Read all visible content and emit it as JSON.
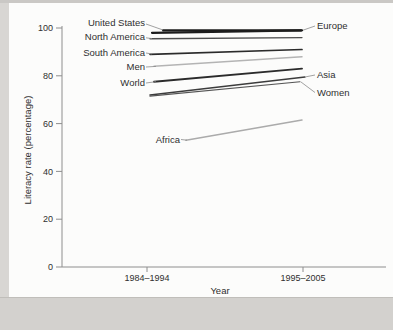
{
  "page": {
    "background_color": "#d8d6d3",
    "panel_color": "#fcfcfb",
    "band_edge_color": "#c0beba"
  },
  "chart_data": {
    "type": "line",
    "title": "",
    "xlabel": "Year",
    "ylabel": "Literacy rate (percentage)",
    "categories": [
      "1984–1994",
      "1995–2005"
    ],
    "ylim": [
      0,
      100
    ],
    "yticks": [
      0,
      20,
      40,
      60,
      80,
      100
    ],
    "grid": false,
    "legend_position": "direct-line-labels",
    "axis_color": "#8e8e8e",
    "text_color": "#2f2f2f",
    "series": [
      {
        "name": "United States",
        "values": [
          99,
          99
        ],
        "label_side": "left",
        "color": "#1c1c1c",
        "width": 2.2
      },
      {
        "name": "Europe",
        "values": [
          98,
          99
        ],
        "label_side": "right",
        "color": "#1c1c1c",
        "width": 2.2
      },
      {
        "name": "North America",
        "values": [
          95.5,
          96
        ],
        "label_side": "left",
        "color": "#4e4e4e",
        "width": 1.3
      },
      {
        "name": "South America",
        "values": [
          89,
          91
        ],
        "label_side": "left",
        "color": "#2b2b2b",
        "width": 1.7
      },
      {
        "name": "Men",
        "values": [
          84,
          88
        ],
        "label_side": "left",
        "color": "#b4b4b4",
        "width": 1.5
      },
      {
        "name": "World",
        "values": [
          77.5,
          83
        ],
        "label_side": "left",
        "color": "#2b2b2b",
        "width": 1.9
      },
      {
        "name": "Asia",
        "values": [
          72,
          79.5
        ],
        "label_side": "right",
        "color": "#3c3c3c",
        "width": 1.5
      },
      {
        "name": "Women",
        "values": [
          71.5,
          77.5
        ],
        "label_side": "right",
        "color": "#555555",
        "width": 1.2
      },
      {
        "name": "Africa",
        "values": [
          53,
          61.5
        ],
        "label_side": "left",
        "color": "#ababab",
        "width": 1.5
      }
    ]
  }
}
